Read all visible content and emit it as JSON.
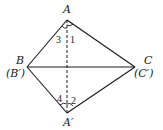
{
  "diagram": {
    "type": "geometry",
    "points": {
      "A": {
        "label": "A",
        "x": 67,
        "y": 20
      },
      "B": {
        "label": "B",
        "alt_label": "(B′)",
        "x": 27,
        "y": 67
      },
      "C": {
        "label": "C",
        "alt_label": "(C′)",
        "x": 135,
        "y": 67
      },
      "A_prime": {
        "label": "A′",
        "x": 67,
        "y": 113
      }
    },
    "segments": [
      {
        "from": "A",
        "to": "B",
        "style": "solid"
      },
      {
        "from": "A",
        "to": "C",
        "style": "solid"
      },
      {
        "from": "B",
        "to": "C",
        "style": "solid"
      },
      {
        "from": "A_prime",
        "to": "B",
        "style": "solid"
      },
      {
        "from": "A_prime",
        "to": "C",
        "style": "solid"
      },
      {
        "from": "A",
        "to": "A_prime",
        "style": "dashed"
      }
    ],
    "angle_labels": {
      "angle1": "1",
      "angle2": "2",
      "angle3": "3",
      "angle4": "4"
    },
    "colors": {
      "stroke": "#1a1a1a",
      "background": "#ffffff"
    }
  }
}
